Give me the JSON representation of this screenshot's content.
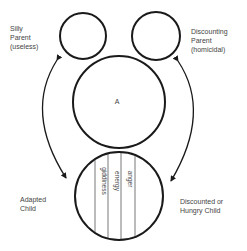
{
  "diagram": {
    "labels": {
      "silly_parent": [
        "Silly",
        "Parent",
        "(useless)"
      ],
      "discounting_parent": [
        "Discounting",
        "Parent",
        "(homicidal)"
      ],
      "adult": "A",
      "adapted_child": [
        "Adapted",
        "Child"
      ],
      "discounted_child": [
        "Discounted or",
        "Hungry Child"
      ]
    },
    "child_segments": [
      "giddiness",
      "energy",
      "anger"
    ],
    "colors": {
      "stroke": "#1a1a1a",
      "thin_line": "#555555",
      "text": "#444444",
      "background": "#ffffff"
    }
  }
}
